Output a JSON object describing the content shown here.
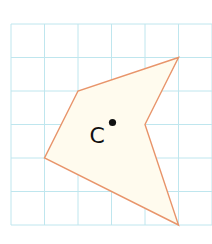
{
  "grid": {
    "cols": 6,
    "rows": 6,
    "origin_x": 11,
    "origin_y": 24,
    "cell_size": 33.5,
    "line_color": "#bfe6ee"
  },
  "polygon": {
    "vertices_grid": [
      [
        5,
        1
      ],
      [
        2,
        2
      ],
      [
        1,
        4
      ],
      [
        5,
        6
      ],
      [
        4,
        3
      ]
    ],
    "stroke_color": "#e8946a",
    "fill_color": "#fffbee"
  },
  "center_point": {
    "label": "C",
    "grid_position": [
      3,
      3
    ],
    "dot_color": "#111111"
  }
}
